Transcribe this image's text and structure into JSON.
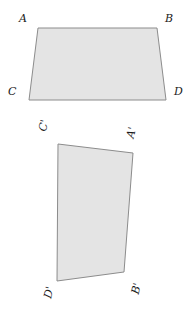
{
  "figure": {
    "background_color": "#ffffff",
    "fill_color": "#e4e4e4",
    "stroke_color": "#8c8c8c",
    "label_color": "#1a1a1a",
    "stroke_width": 1
  },
  "shapes": [
    {
      "id": "quad-abdc",
      "name": "upper-quadrilateral",
      "vertex_order": [
        "A",
        "B",
        "D",
        "C"
      ],
      "points": "38,28 157,28 166,100 29,100",
      "fill": "#e4e4e4",
      "stroke": "#8c8c8c"
    },
    {
      "id": "quad-capbd",
      "name": "lower-quadrilateral",
      "vertex_order": [
        "C'",
        "A'",
        "B'",
        "D'"
      ],
      "points": "58,144 133,153 124,272 57,281",
      "fill": "#e4e4e4",
      "stroke": "#8c8c8c"
    }
  ],
  "labels": {
    "upper": {
      "a": "A",
      "b": "B",
      "c": "C",
      "d": "D"
    },
    "lower": {
      "a_prime": "A'",
      "b_prime": "B'",
      "c_prime": "C'",
      "d_prime": "D'"
    }
  }
}
